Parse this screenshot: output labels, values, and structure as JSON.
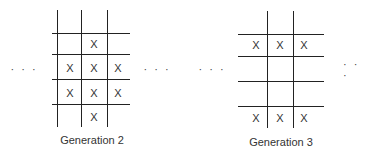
{
  "ellipsis": "· · ·",
  "panels": [
    {
      "caption": "Generation 2",
      "grid": [
        [
          "",
          "X",
          ""
        ],
        [
          "X",
          "X",
          "X"
        ],
        [
          "X",
          "X",
          "X"
        ],
        [
          "",
          "X",
          ""
        ]
      ]
    },
    {
      "caption": "Generation 3",
      "grid": [
        [
          "X",
          "X",
          "X"
        ],
        [
          "",
          "",
          ""
        ],
        [
          "",
          "",
          ""
        ],
        [
          "X",
          "X",
          "X"
        ]
      ]
    }
  ]
}
